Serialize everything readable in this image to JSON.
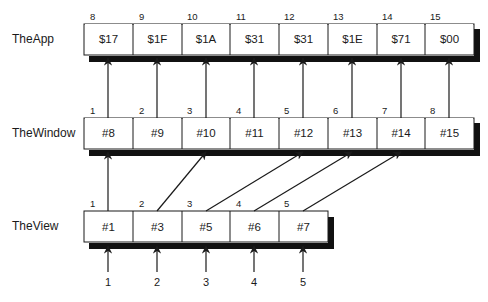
{
  "rows": [
    {
      "label": "TheApp",
      "indices": [
        "8",
        "9",
        "10",
        "11",
        "12",
        "13",
        "14",
        "15"
      ],
      "cells": [
        "$17",
        "$1F",
        "$1A",
        "$31",
        "$31",
        "$1E",
        "$71",
        "$00"
      ]
    },
    {
      "label": "TheWindow",
      "indices": [
        "1",
        "2",
        "3",
        "4",
        "5",
        "6",
        "7",
        "8"
      ],
      "cells": [
        "#8",
        "#9",
        "#10",
        "#11",
        "#12",
        "#13",
        "#14",
        "#15"
      ]
    },
    {
      "label": "TheView",
      "indices": [
        "1",
        "2",
        "3",
        "4",
        "5"
      ],
      "cells": [
        "#1",
        "#3",
        "#5",
        "#6",
        "#7"
      ]
    }
  ],
  "input_numbers": [
    "1",
    "2",
    "3",
    "4",
    "5"
  ],
  "colors": {
    "line": "#1a1a1a",
    "shadow": "#111111",
    "background": "#ffffff"
  }
}
